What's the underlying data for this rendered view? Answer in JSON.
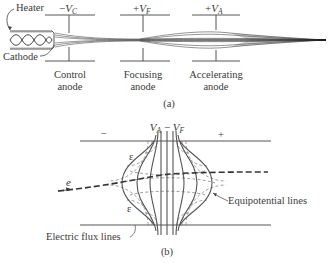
{
  "figure_a": {
    "caption": "(a)",
    "heater_label": "Heater",
    "cathode_label": "Cathode",
    "electrodes": [
      {
        "id": "control",
        "voltage_sign": "−",
        "voltage_var": "V",
        "voltage_sub": "C",
        "name_line1": "Control",
        "name_line2": "anode"
      },
      {
        "id": "focusing",
        "voltage_sign": "+",
        "voltage_var": "V",
        "voltage_sub": "F",
        "name_line1": "Focusing",
        "name_line2": "anode"
      },
      {
        "id": "accelerating",
        "voltage_sign": "+",
        "voltage_var": "V",
        "voltage_sub": "A",
        "name_line1": "Accelerating",
        "name_line2": "anode"
      }
    ]
  },
  "figure_b": {
    "caption": "(b)",
    "potential_label": {
      "v1": "V",
      "s1": "A",
      "op": " − ",
      "v2": "V",
      "s2": "F"
    },
    "minus_sign": "−",
    "plus_sign": "+",
    "field_symbol_top": "ε",
    "field_symbol_bottom": "ε",
    "electron_label": "e",
    "equipotential_label": "Equipotential lines",
    "flux_label": "Electric flux lines"
  }
}
